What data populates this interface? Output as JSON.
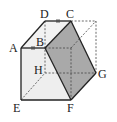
{
  "figure": {
    "colors": {
      "section_fill": "#a9a9a9",
      "face_fill": "#eeeeee",
      "line": "#222222"
    },
    "vertices": [
      {
        "name": "A"
      },
      {
        "name": "B"
      },
      {
        "name": "C"
      },
      {
        "name": "D"
      },
      {
        "name": "E"
      },
      {
        "name": "F"
      },
      {
        "name": "G"
      },
      {
        "name": "H"
      }
    ],
    "marks": [
      "AB equal-length tick",
      "DC equal-length tick"
    ],
    "shaded_section": "BCGF"
  }
}
